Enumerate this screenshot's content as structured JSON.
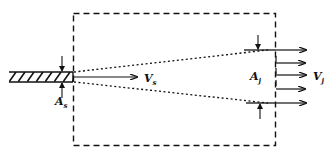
{
  "diagram": {
    "labels": {
      "source_velocity": {
        "main": "V",
        "sub": "s"
      },
      "source_area": {
        "main": "A",
        "sub": "s"
      },
      "jet_area": {
        "main": "A",
        "sub": "j"
      },
      "jet_velocity": {
        "main": "V",
        "sub": "j"
      }
    },
    "elements": {
      "control_volume": "dashed rectangle",
      "nozzle": "hatched pipe",
      "jet_boundaries": "dotted spreading lines",
      "outflow_arrows": 5
    },
    "colors": {
      "ink": "#111111",
      "background": "#ffffff"
    }
  }
}
